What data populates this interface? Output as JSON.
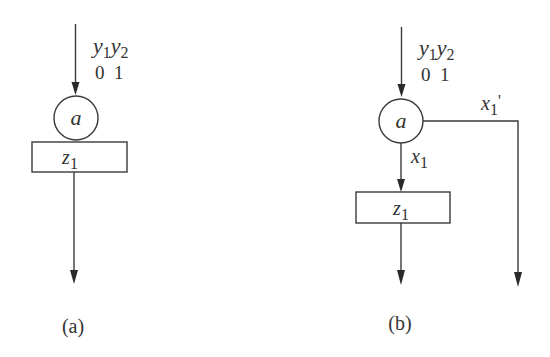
{
  "diagram_a": {
    "caption": "(a)",
    "input_label_top": {
      "y1": "y",
      "y1_sub": "1",
      "y2": "y",
      "y2_sub": "2"
    },
    "input_values": "0  1",
    "node": "a",
    "operation_box": {
      "var": "z",
      "sub": "1"
    }
  },
  "diagram_b": {
    "caption": "(b)",
    "input_label_top": {
      "y1": "y",
      "y1_sub": "1",
      "y2": "y",
      "y2_sub": "2"
    },
    "input_values": "0  1",
    "node": "a",
    "branch_true": {
      "var": "x",
      "sub": "1"
    },
    "branch_false": {
      "var": "x",
      "sub": "1",
      "prime": "'"
    },
    "operation_box": {
      "var": "z",
      "sub": "1"
    }
  },
  "colors": {
    "stroke": "#3a3a3a",
    "text": "#333333",
    "background": "#ffffff"
  }
}
